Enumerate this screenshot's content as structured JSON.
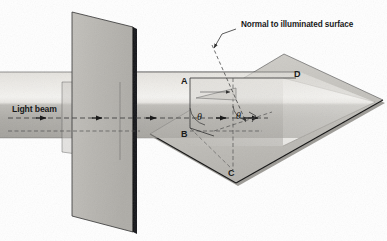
{
  "figure": {
    "width": 387,
    "height": 241,
    "background": "#ffffff"
  },
  "labels": {
    "normal_caption": "Normal to illuminated surface",
    "light_beam": "Light beam",
    "point_a": "A",
    "point_b": "B",
    "point_c": "C",
    "point_d": "D",
    "theta_incidence": "θ",
    "theta_normal": "θ"
  },
  "icons": {
    "beam_direction_arrow": "arrow-right-icon",
    "normal_leader_arrow": "arrow-down-left-icon",
    "normal_direction_arrow": "arrow-down-right-icon",
    "right_angle_marker": "right-angle-icon"
  },
  "colors": {
    "background": "#ffffff",
    "beam_light": "#f2f1ee",
    "beam_upper": "#d9d7d2",
    "beam_lower": "#a9a7a2",
    "plane_face": "#b9b7b2",
    "plane_edge_dark": "#1a1a1a",
    "surface_top": "#c9c7c2",
    "surface_side": "#9d9b96",
    "surface_edge_dark": "#111111",
    "stroke": "#2b2b2b",
    "text": "#111111"
  },
  "geometry": {
    "beam_band_top": 72,
    "beam_band_bottom": 138,
    "beam_axis_y": 118,
    "vertical_plane_x": 108,
    "surface_apex_x": 375
  }
}
